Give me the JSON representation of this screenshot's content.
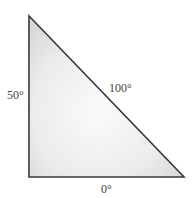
{
  "diagram": {
    "shape": "right triangle",
    "vertices": {
      "top": [
        29,
        16
      ],
      "bottom_left": [
        29,
        177
      ],
      "bottom_right": [
        184,
        177
      ]
    },
    "fill_color": "#e4e4e4",
    "stroke_color": "#3a3a3a",
    "labels": {
      "left_side": "50°",
      "hypotenuse": "100°",
      "bottom_side": "0°"
    }
  }
}
